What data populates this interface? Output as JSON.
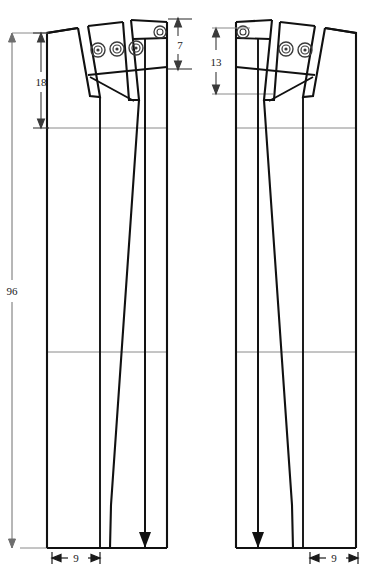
{
  "drawing": {
    "title": "Trouser pattern construction drawing",
    "type": "technical-pattern",
    "background_color": "#ffffff",
    "line_color": "#111111",
    "thin_line_color": "#6e6e6e",
    "canvas": {
      "width": 376,
      "height": 578
    }
  },
  "dimensions": [
    {
      "id": "overall-height",
      "label": "96",
      "orientation": "vertical",
      "position": "far-left",
      "from_y": 33,
      "to_y": 548
    },
    {
      "id": "left-hip-depth",
      "label": "18",
      "orientation": "vertical",
      "position": "left-inner",
      "from_y": 33,
      "to_y": 128
    },
    {
      "id": "left-yoke-height",
      "label": "7",
      "orientation": "vertical",
      "position": "left-panel-right",
      "from_y": 18,
      "to_y": 70
    },
    {
      "id": "right-hip-depth",
      "label": "13",
      "orientation": "vertical",
      "position": "right-inner",
      "from_y": 28,
      "to_y": 94
    },
    {
      "id": "left-hem-width",
      "label": "9",
      "orientation": "horizontal",
      "position": "bottom-left",
      "from_x": 52,
      "to_x": 100
    },
    {
      "id": "right-hem-width",
      "label": "9",
      "orientation": "horizontal",
      "position": "bottom-right",
      "from_x": 322,
      "to_x": 370
    }
  ],
  "panels": [
    {
      "id": "left-panel",
      "name": "front-piece",
      "grain_arrow": true,
      "dart_count": 2,
      "rivet_marks": 3,
      "horizontal_guides": [
        128,
        352
      ],
      "hem_y": 548
    },
    {
      "id": "right-panel",
      "name": "back-piece",
      "grain_arrow": true,
      "dart_count": 2,
      "rivet_marks": 2,
      "horizontal_guides": [
        128,
        352
      ],
      "hem_y": 548
    }
  ],
  "marks": {
    "rivet_icon": "concentric-circle-mark",
    "grain_arrow_icon": "down-arrow",
    "dim_arrow_icon": "dimension-arrow"
  }
}
